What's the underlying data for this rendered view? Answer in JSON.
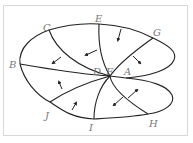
{
  "diagram": {
    "title": "",
    "labels": {
      "A": "A",
      "B": "B",
      "C": "C",
      "D": "D",
      "E": "E",
      "F": "F",
      "G": "G",
      "H": "H",
      "I": "I",
      "J": "J"
    },
    "colors": {
      "line": "#222222",
      "label": "#777777",
      "frame": "#d8d8d8"
    }
  }
}
